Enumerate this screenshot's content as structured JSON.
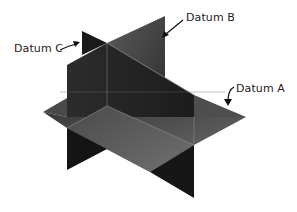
{
  "diagram": {
    "labels": {
      "datum_a": "Datum A",
      "datum_b": "Datum B",
      "datum_c": "Datum C"
    },
    "colors": {
      "background": "#ffffff",
      "plane_dark": "#1e1e1e",
      "plane_mid": "#3a3a3a",
      "plane_light": "#6a6a6a",
      "edge_highlight": "#9a9a9a",
      "text": "#222222",
      "arrow": "#111111"
    }
  }
}
